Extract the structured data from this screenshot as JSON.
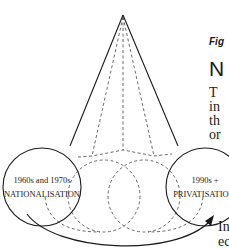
{
  "diagram": {
    "left_circle": {
      "line1": "1960s and 1970s",
      "line2": "NATIONALISATION"
    },
    "right_circle": {
      "line1": "1990s +",
      "line2": "PRIVATISATION"
    },
    "colors": {
      "stroke": "#1a1a1a",
      "dashed": "#444444",
      "background": "#ffffff"
    }
  },
  "side_text": {
    "figure_label": "Fig",
    "heading": "N",
    "paragraph1": [
      "T",
      "in",
      "th",
      "or"
    ],
    "paragraph2": [
      "In",
      "ec"
    ]
  }
}
